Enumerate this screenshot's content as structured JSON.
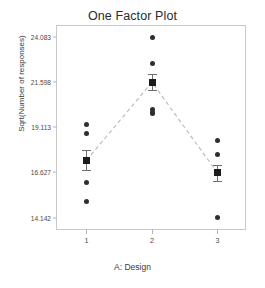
{
  "chart_data": {
    "type": "scatter",
    "title": "One Factor Plot",
    "xlabel": "A: Design",
    "ylabel": "Sqrt(Number of responses)",
    "grid": false,
    "legend": null,
    "xlim": [
      0.55,
      3.45
    ],
    "ylim": [
      13.4,
      24.7
    ],
    "categories": [
      "1",
      "2",
      "3"
    ],
    "xticks": [
      "1",
      "2",
      "3"
    ],
    "yticks": [
      "14.142",
      "16.627",
      "19.113",
      "21.598",
      "24.083"
    ],
    "ytick_values": [
      14.142,
      16.627,
      19.113,
      21.598,
      24.083
    ],
    "mean_connector": {
      "style": "dashed",
      "color": "#b9b9b9",
      "values": [
        17.3,
        21.6,
        16.6
      ]
    },
    "groups": [
      {
        "category": "1",
        "x": 1,
        "mean": 17.3,
        "error": 0.55,
        "points": [
          19.27,
          18.8,
          17.35,
          16.05,
          15.05
        ]
      },
      {
        "category": "2",
        "x": 2,
        "mean": 21.6,
        "error": 0.45,
        "points": [
          24.083,
          22.63,
          21.62,
          20.1,
          19.95,
          19.85
        ]
      },
      {
        "category": "3",
        "x": 3,
        "mean": 16.6,
        "error": 0.45,
        "points": [
          18.37,
          17.6,
          16.63,
          14.142
        ]
      }
    ],
    "marker_colors": {
      "point": "#2e2e2e",
      "mean": "#1c1c1c",
      "errorbar": "#6f6f6f",
      "frame": "#c9c9c9"
    }
  }
}
